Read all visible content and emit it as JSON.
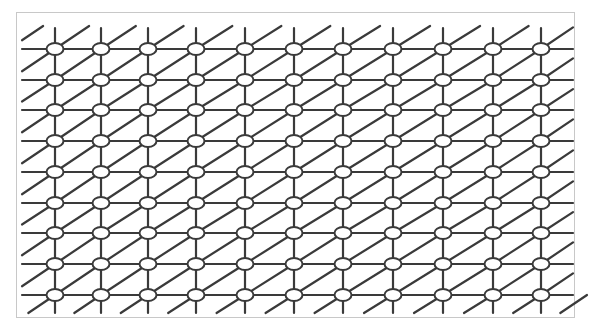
{
  "diagram": {
    "type": "triangular-lattice-grid",
    "frame": {
      "x": 16,
      "y": 12,
      "width": 559,
      "height": 306,
      "border_color": "#c8c8c8"
    },
    "columns_x": [
      55,
      101,
      148,
      196,
      245,
      294,
      343,
      393,
      443,
      493,
      541
    ],
    "rows_y": [
      49,
      80,
      110,
      141,
      172,
      203,
      233,
      264,
      295
    ],
    "node": {
      "rx": 8.5,
      "ry": 6,
      "fill": "#ffffff",
      "stroke": "#3a3a3a"
    },
    "line_color": "#3a3a3a",
    "line_width": 2.2,
    "horizontal_extent": [
      22,
      573
    ],
    "vertical_extent": [
      28,
      313
    ],
    "edges": [
      "horizontal",
      "vertical",
      "diagonal-up-right"
    ]
  }
}
